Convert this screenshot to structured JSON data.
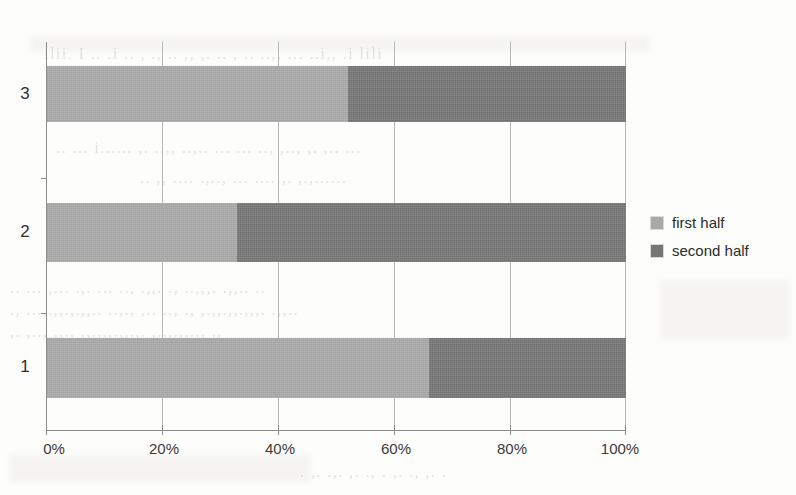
{
  "chart_data": {
    "type": "bar",
    "orientation": "horizontal",
    "stacked": true,
    "normalized": "100%",
    "title": "",
    "subtitle": "",
    "xlabel": "",
    "ylabel": "",
    "categories": [
      "1",
      "2",
      "3"
    ],
    "xticks": [
      "0%",
      "20%",
      "40%",
      "60%",
      "80%",
      "100%"
    ],
    "xtick_values": [
      0,
      20,
      40,
      60,
      80,
      100
    ],
    "xlim": [
      0,
      100
    ],
    "grid": "vertical",
    "legend_position": "right",
    "series": [
      {
        "name": "first half",
        "color": "#a9a9a9",
        "values": [
          66,
          33,
          52
        ]
      },
      {
        "name": "second half",
        "color": "#767676",
        "values": [
          34,
          67,
          48
        ]
      }
    ],
    "bars": [
      {
        "category": "3",
        "first_half": 52,
        "second_half": 48
      },
      {
        "category": "2",
        "first_half": 33,
        "second_half": 67
      },
      {
        "category": "1",
        "first_half": 66,
        "second_half": 34
      }
    ]
  },
  "legend": {
    "items": [
      {
        "label": "first half",
        "color": "#a9a9a9"
      },
      {
        "label": "second half",
        "color": "#767676"
      }
    ]
  },
  "axis": {
    "x_tick_labels": [
      "0%",
      "20%",
      "40%",
      "60%",
      "80%",
      "100%"
    ],
    "y_tick_labels": [
      "3",
      "2",
      "1"
    ]
  },
  "page": {
    "ghost_text": [
      "ilii. I  ..  .i  ..  ,  .,   .. ,,  ,. .. , ..   ..,, ...  ..i,, .i lili",
      "..     ... i......  ,. ..,, ..,.. ... ... .., ,.., ,.   ,.. ...",
      ".. ,,  ....  .,..,  ...  ....  ,. ,.,......",
      "..  ...  ,...  .,. ...  ..,  .,,.  .,  ..,,,. .,,..  ..",
      ".,  ...,.,,.,.,,.. ..,., ,.. ..,  .,  ,.,,.,,.,,,. .,,..",
      ",.  ,.., ,,.. ,,.,.,.,,.,. ,..,.,,.,, .,",
      " .  ,.  .,.  ,.  .,    . ,.  .,  ,.  ."
    ]
  }
}
